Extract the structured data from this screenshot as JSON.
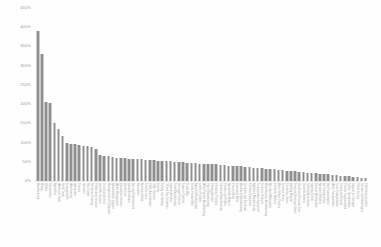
{
  "chart_data": {
    "type": "bar",
    "title": "",
    "subtitle": "",
    "xlabel": "",
    "ylabel": "",
    "ylim": [
      0,
      450
    ],
    "grid": false,
    "legend": null,
    "y_ticks": [
      "0%",
      "50%",
      "100%",
      "150%",
      "200%",
      "250%",
      "300%",
      "350%",
      "400%",
      "450%"
    ],
    "y_tick_values": [
      0,
      50,
      100,
      150,
      200,
      250,
      300,
      350,
      400,
      450
    ],
    "bar_color": "#8f8f8f",
    "background_color": "#ffffff",
    "axis_label_color": "#9a9a9a",
    "categories": [
      "Manufacturing",
      "Mining",
      "Utilities",
      "Construction",
      "Agriculture",
      "Wholesale Trade",
      "Retail Trade",
      "Transportation",
      "Warehousing",
      "Information",
      "Finance",
      "Insurance",
      "Real Estate",
      "Rental and Leasing",
      "Professional Services",
      "Scientific Services",
      "Technical Services",
      "Management of Companies",
      "Administrative Support",
      "Waste Management",
      "Educational Services",
      "Health Care",
      "Social Assistance",
      "Arts and Entertainment",
      "Recreation",
      "Accommodation",
      "Food Services",
      "Public Administration",
      "Other Services",
      "Forestry",
      "Fishing and Hunting",
      "Oil and Gas Extraction",
      "Support Activities",
      "Food Manufacturing",
      "Beverage Products",
      "Tobacco Products",
      "Textile Mills",
      "Textile Product Mills",
      "Apparel Manufacturing",
      "Leather Products",
      "Wood Product Manufacturing",
      "Paper Manufacturing",
      "Printing Activities",
      "Petroleum Products",
      "Chemical Manufacturing",
      "Plastics and Rubber",
      "Nonmetallic Mineral",
      "Primary Metal",
      "Fabricated Metal",
      "Machinery Manufacturing",
      "Computer and Electronic",
      "Electrical Equipment",
      "Appliance Manufacturing",
      "Transportation Equipment",
      "Furniture Products",
      "Miscellaneous Manufacturing",
      "Merchant Wholesalers",
      "Electronic Markets",
      "Motor Vehicle Dealers",
      "Furniture Stores",
      "Electronics Stores",
      "Building Material",
      "Food and Beverage Stores",
      "Health and Personal Care",
      "Gasoline Stations",
      "Clothing Accessories",
      "Sporting Goods",
      "General Merchandise",
      "Nonstore Retailers",
      "Air Transportation",
      "Rail Transportation",
      "Water Transportation",
      "Truck Transportation",
      "Transit and Ground",
      "Pipeline Transportation",
      "Scenic Transportation",
      "Support for Transport",
      "Postal Service",
      "Couriers and Messengers",
      "Publishing Industries"
    ],
    "values": [
      390,
      330,
      205,
      204,
      152,
      135,
      117,
      98,
      96,
      95,
      93,
      92,
      90,
      88,
      84,
      67,
      66,
      64,
      62,
      60,
      60,
      59,
      58,
      58,
      57,
      56,
      55,
      55,
      54,
      53,
      52,
      52,
      51,
      50,
      49,
      49,
      48,
      47,
      46,
      45,
      45,
      44,
      43,
      43,
      42,
      41,
      40,
      40,
      39,
      38,
      37,
      36,
      35,
      34,
      33,
      32,
      31,
      30,
      29,
      28,
      27,
      26,
      25,
      24,
      23,
      22,
      21,
      20,
      19,
      18,
      17,
      16,
      15,
      14,
      13,
      12,
      11,
      10,
      9,
      8
    ]
  }
}
